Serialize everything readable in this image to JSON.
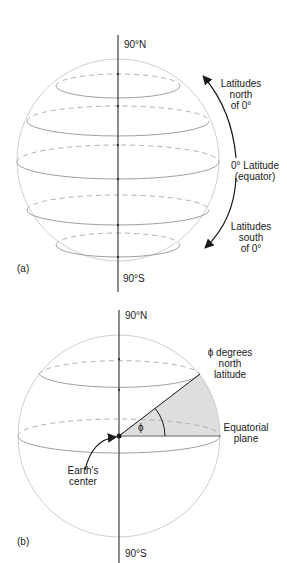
{
  "panel_a": {
    "label": "(a)",
    "pole_north": "90°N",
    "pole_south": "90°S",
    "annotation_north": [
      "Latitudes",
      "north",
      "of 0°"
    ],
    "annotation_equator": [
      "0° Latitude",
      "(equator)"
    ],
    "annotation_south": [
      "Latitudes",
      "south",
      "of 0°"
    ]
  },
  "panel_b": {
    "label": "(b)",
    "pole_north": "90°N",
    "pole_south": "90°S",
    "annotation_latitude": [
      "ϕ degrees",
      "north",
      "latitude"
    ],
    "annotation_plane": [
      "Equatorial",
      "plane"
    ],
    "annotation_center": [
      "Earth's",
      "center"
    ],
    "angle_symbol": "ϕ"
  },
  "colors": {
    "sphere_outline": "#c8c8c8",
    "latitude_line": "#a8a8a8",
    "axis": "#1a1a1a",
    "wedge_fill": "#dcdcdc"
  }
}
